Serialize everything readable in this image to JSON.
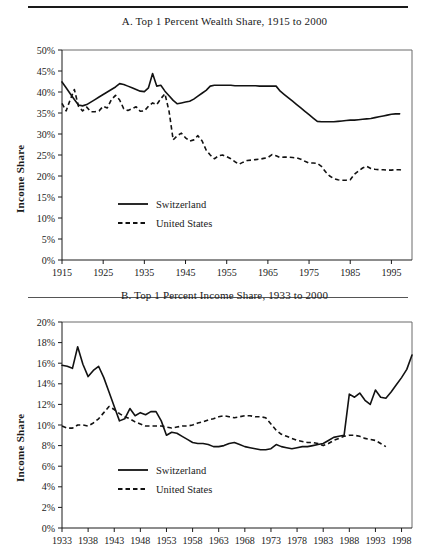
{
  "figure": {
    "panels": [
      "A",
      "B"
    ],
    "rules": {
      "top": true,
      "middle": true
    }
  },
  "chart_data": [
    {
      "panel": "A",
      "type": "line",
      "title": "A. Top 1 Percent Wealth Share, 1915 to 2000",
      "xlabel": "",
      "ylabel": "Income Share",
      "xlim": [
        1915,
        2000
      ],
      "ylim": [
        0,
        50
      ],
      "grid": false,
      "legend_position": "inside-lower-left",
      "ytick_labels": [
        "0%",
        "5%",
        "10%",
        "15%",
        "20%",
        "25%",
        "30%",
        "35%",
        "40%",
        "45%",
        "50%"
      ],
      "ytick_values": [
        0,
        5,
        10,
        15,
        20,
        25,
        30,
        35,
        40,
        45,
        50
      ],
      "xtick_labels": [
        "1915",
        "1925",
        "1935",
        "1945",
        "1955",
        "1965",
        "1975",
        "1985",
        "1995"
      ],
      "xtick_values": [
        1915,
        1925,
        1935,
        1945,
        1955,
        1965,
        1975,
        1985,
        1995
      ],
      "series": [
        {
          "name": "Switzerland",
          "style": "solid",
          "x": [
            1915,
            1916,
            1917,
            1918,
            1919,
            1920,
            1921,
            1922,
            1923,
            1924,
            1925,
            1926,
            1927,
            1928,
            1929,
            1930,
            1931,
            1932,
            1933,
            1934,
            1935,
            1936,
            1937,
            1938,
            1939,
            1940,
            1941,
            1942,
            1943,
            1944,
            1945,
            1946,
            1947,
            1948,
            1949,
            1950,
            1951,
            1952,
            1953,
            1954,
            1955,
            1956,
            1957,
            1958,
            1959,
            1960,
            1961,
            1962,
            1963,
            1964,
            1965,
            1966,
            1967,
            1968,
            1969,
            1970,
            1971,
            1972,
            1973,
            1974,
            1975,
            1976,
            1977,
            1978,
            1979,
            1980,
            1981,
            1982,
            1983,
            1984,
            1985,
            1986,
            1987,
            1988,
            1989,
            1990,
            1991,
            1992,
            1993,
            1994,
            1995,
            1996,
            1997
          ],
          "y": [
            42.4,
            41.0,
            39.6,
            38.2,
            36.9,
            36.7,
            37.0,
            37.6,
            38.2,
            38.8,
            39.4,
            40.0,
            40.6,
            41.2,
            42.0,
            41.8,
            41.4,
            41.0,
            40.6,
            40.2,
            40.1,
            41.0,
            44.4,
            41.4,
            41.6,
            40.2,
            39.1,
            38.0,
            37.2,
            37.4,
            37.6,
            37.8,
            38.3,
            39.0,
            39.7,
            40.4,
            41.4,
            41.6,
            41.6,
            41.6,
            41.6,
            41.6,
            41.5,
            41.5,
            41.5,
            41.5,
            41.5,
            41.5,
            41.4,
            41.4,
            41.4,
            41.4,
            41.4,
            40.2,
            39.4,
            38.6,
            37.8,
            37.0,
            36.2,
            35.4,
            34.6,
            33.8,
            33.0,
            32.9,
            32.9,
            32.9,
            32.9,
            33.0,
            33.1,
            33.2,
            33.3,
            33.3,
            33.4,
            33.5,
            33.6,
            33.7,
            33.9,
            34.1,
            34.3,
            34.5,
            34.7,
            34.8,
            34.8
          ]
        },
        {
          "name": "United States",
          "style": "dashed",
          "x": [
            1915,
            1916,
            1917,
            1918,
            1919,
            1920,
            1921,
            1922,
            1923,
            1924,
            1925,
            1926,
            1927,
            1928,
            1929,
            1930,
            1931,
            1932,
            1933,
            1934,
            1935,
            1936,
            1937,
            1938,
            1939,
            1940,
            1941,
            1942,
            1943,
            1944,
            1945,
            1946,
            1947,
            1948,
            1949,
            1950,
            1951,
            1952,
            1953,
            1954,
            1955,
            1956,
            1957,
            1958,
            1959,
            1960,
            1961,
            1962,
            1963,
            1964,
            1965,
            1966,
            1967,
            1968,
            1969,
            1970,
            1971,
            1972,
            1973,
            1974,
            1975,
            1976,
            1977,
            1978,
            1979,
            1980,
            1981,
            1982,
            1983,
            1984,
            1985,
            1986,
            1987,
            1988,
            1989,
            1990,
            1991,
            1992,
            1993,
            1994,
            1995,
            1996,
            1997,
            1998
          ],
          "y": [
            37.3,
            35.5,
            38.2,
            40.6,
            36.6,
            35.5,
            36.4,
            35.3,
            35.3,
            35.5,
            36.6,
            36.2,
            38.2,
            39.2,
            38.1,
            36.0,
            35.6,
            36.0,
            36.5,
            35.4,
            35.5,
            36.6,
            37.4,
            37.0,
            38.4,
            39.6,
            35.4,
            28.6,
            29.6,
            30.2,
            29.1,
            28.3,
            28.6,
            29.6,
            28.4,
            26.2,
            25.0,
            24.1,
            24.8,
            25.0,
            24.6,
            24.1,
            23.4,
            22.8,
            23.3,
            23.7,
            23.8,
            23.9,
            24.0,
            24.2,
            24.4,
            25.1,
            24.8,
            24.4,
            24.5,
            24.5,
            24.4,
            24.3,
            24.0,
            23.5,
            23.1,
            23.1,
            23.0,
            22.3,
            21.0,
            20.0,
            19.4,
            19.1,
            19.0,
            19.0,
            19.1,
            20.4,
            21.2,
            21.9,
            22.3,
            21.8,
            21.6,
            21.5,
            21.5,
            21.4,
            21.4,
            21.5,
            21.5,
            21.2
          ]
        }
      ],
      "legend": [
        {
          "label": "Switzerland",
          "style": "solid"
        },
        {
          "label": "United States",
          "style": "dashed"
        }
      ]
    },
    {
      "panel": "B",
      "type": "line",
      "title": "B. Top 1 Percent Income Share, 1933 to 2000",
      "xlabel": "",
      "ylabel": "Income Share",
      "xlim": [
        1933,
        2000
      ],
      "ylim": [
        0,
        20
      ],
      "grid": false,
      "legend_position": "inside-lower-left",
      "ytick_labels": [
        "0%",
        "2%",
        "4%",
        "6%",
        "8%",
        "10%",
        "12%",
        "14%",
        "16%",
        "18%",
        "20%"
      ],
      "ytick_values": [
        0,
        2,
        4,
        6,
        8,
        10,
        12,
        14,
        16,
        18,
        20
      ],
      "xtick_labels": [
        "1933",
        "1938",
        "1943",
        "1948",
        "1953",
        "1958",
        "1963",
        "1968",
        "1973",
        "1978",
        "1983",
        "1988",
        "1993",
        "1998"
      ],
      "xtick_values": [
        1933,
        1938,
        1943,
        1948,
        1953,
        1958,
        1963,
        1968,
        1973,
        1978,
        1983,
        1988,
        1993,
        1998
      ],
      "series": [
        {
          "name": "Switzerland",
          "style": "solid",
          "x": [
            1933,
            1934,
            1935,
            1936,
            1937,
            1938,
            1939,
            1940,
            1941,
            1942,
            1943,
            1944,
            1945,
            1946,
            1947,
            1948,
            1949,
            1950,
            1951,
            1952,
            1953,
            1954,
            1955,
            1956,
            1957,
            1958,
            1959,
            1960,
            1961,
            1962,
            1963,
            1964,
            1965,
            1966,
            1967,
            1968,
            1969,
            1970,
            1971,
            1972,
            1973,
            1974,
            1975,
            1976,
            1977,
            1978,
            1979,
            1980,
            1981,
            1982,
            1983,
            1984,
            1985,
            1986,
            1987,
            1988,
            1989,
            1990,
            1991,
            1992,
            1993,
            1994,
            1995,
            1996,
            1997,
            1998,
            1999,
            2000
          ],
          "y": [
            15.8,
            15.7,
            15.5,
            17.6,
            15.9,
            14.7,
            15.3,
            15.7,
            14.6,
            13.2,
            11.8,
            10.4,
            10.6,
            11.6,
            10.9,
            11.2,
            11.0,
            11.3,
            11.3,
            10.4,
            9.0,
            9.3,
            9.2,
            8.9,
            8.6,
            8.3,
            8.2,
            8.2,
            8.1,
            7.9,
            7.9,
            8.0,
            8.2,
            8.3,
            8.1,
            7.9,
            7.8,
            7.7,
            7.6,
            7.6,
            7.7,
            8.1,
            7.9,
            7.8,
            7.7,
            7.8,
            7.9,
            7.9,
            8.0,
            8.1,
            8.2,
            8.5,
            8.8,
            8.9,
            9.0,
            13.0,
            12.7,
            13.1,
            12.4,
            12.0,
            13.4,
            12.7,
            12.6,
            13.2,
            13.9,
            14.6,
            15.4,
            16.8
          ]
        },
        {
          "name": "United States",
          "style": "dashed",
          "x": [
            1933,
            1934,
            1935,
            1936,
            1937,
            1938,
            1939,
            1940,
            1941,
            1942,
            1943,
            1944,
            1945,
            1946,
            1947,
            1948,
            1949,
            1950,
            1951,
            1952,
            1953,
            1954,
            1955,
            1956,
            1957,
            1958,
            1959,
            1960,
            1961,
            1962,
            1963,
            1964,
            1965,
            1966,
            1967,
            1968,
            1969,
            1970,
            1971,
            1972,
            1973,
            1974,
            1975,
            1976,
            1977,
            1978,
            1979,
            1980,
            1981,
            1982,
            1983,
            1984,
            1985,
            1986,
            1987,
            1988,
            1989,
            1990,
            1991,
            1992,
            1993,
            1994,
            1995
          ],
          "y": [
            9.9,
            9.7,
            9.7,
            10.0,
            10.0,
            9.9,
            10.2,
            10.6,
            11.2,
            11.8,
            11.5,
            11.1,
            10.8,
            10.6,
            10.3,
            10.1,
            9.9,
            9.9,
            9.9,
            9.9,
            9.8,
            9.7,
            9.8,
            9.9,
            9.9,
            10.0,
            10.2,
            10.3,
            10.5,
            10.6,
            10.8,
            10.9,
            10.8,
            10.7,
            10.8,
            10.9,
            10.9,
            10.8,
            10.8,
            10.7,
            10.1,
            9.5,
            9.1,
            8.9,
            8.7,
            8.5,
            8.4,
            8.3,
            8.3,
            8.2,
            8.0,
            8.2,
            8.5,
            8.7,
            8.9,
            9.0,
            9.0,
            8.9,
            8.7,
            8.6,
            8.5,
            8.2,
            7.9
          ]
        }
      ],
      "legend": [
        {
          "label": "Switzerland",
          "style": "solid"
        },
        {
          "label": "United States",
          "style": "dashed"
        }
      ]
    }
  ]
}
